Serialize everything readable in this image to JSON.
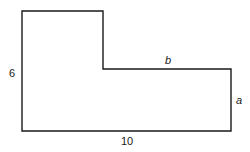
{
  "figure": {
    "labels": {
      "left_side": "6",
      "bottom_side": "10",
      "step_top": "b",
      "right_side": "a"
    },
    "colors": {
      "stroke": "#1a1a1a",
      "background": "#ffffff"
    }
  }
}
